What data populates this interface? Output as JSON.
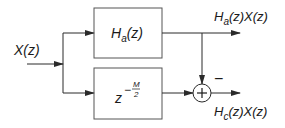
{
  "diagram": {
    "input_label": {
      "main": "X(z)"
    },
    "block_top": {
      "base": "H",
      "sub": "a",
      "rest": "(z)"
    },
    "block_bottom": {
      "base": "z",
      "exp_sign": "−",
      "exp_num": "M",
      "exp_den": "2"
    },
    "summer": {
      "symbol": "+",
      "minus_sign": "−"
    },
    "output_top": {
      "base": "H",
      "sub": "a",
      "rest": "(z)X(z)"
    },
    "output_bottom": {
      "base": "H",
      "sub": "c",
      "rest": "(z)X(z)"
    },
    "colors": {
      "line": "#2a2a2a",
      "box": "#555555"
    }
  }
}
